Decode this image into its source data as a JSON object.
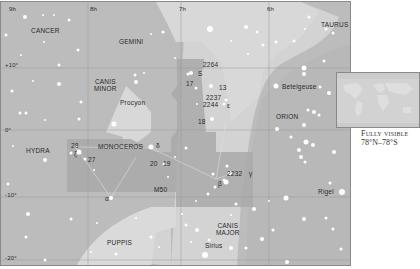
{
  "map": {
    "ra_labels": [
      "9h",
      "8h",
      "7h",
      "6h"
    ],
    "dec_labels": [
      "+10°",
      "0°",
      "-10°",
      "-20°"
    ],
    "constellations": [
      {
        "name": "CANCER"
      },
      {
        "name": "GEMINI"
      },
      {
        "name": "TAURUS"
      },
      {
        "name": "CANIS MINOR",
        "line1": "CANIS",
        "line2": "MINOR"
      },
      {
        "name": "ORION"
      },
      {
        "name": "HYDRA"
      },
      {
        "name": "MONOCEROS"
      },
      {
        "name": "CANIS MAJOR",
        "line1": "CANIS",
        "line2": "MAJOR"
      },
      {
        "name": "PUPPIS"
      }
    ],
    "stars": {
      "procyon": "Procyon",
      "betelgeuse": "Betelgeuse",
      "rigel": "Rigel",
      "sirius": "Sirius"
    },
    "objects": {
      "n2264": "2264",
      "s": "S",
      "n17": "17",
      "n13": "13",
      "n2237": "2237",
      "n2244": "2244",
      "epsilon": "ε",
      "n18": "18",
      "delta": "δ",
      "n20": "20",
      "n19": "19",
      "n28": "28",
      "zeta": "ζ",
      "n27": "27",
      "alpha": "α",
      "m50": "M50",
      "n2232": "2232",
      "beta": "β",
      "gamma": "γ"
    }
  },
  "inset": {
    "caption_line1": "Fully visible",
    "caption_line2": "78°N–78°S"
  },
  "colors": {
    "sky": "#bcbcbc",
    "milky_way": "#d6d6d6",
    "highlight": "#a6a6a6",
    "star": "#ffffff"
  }
}
